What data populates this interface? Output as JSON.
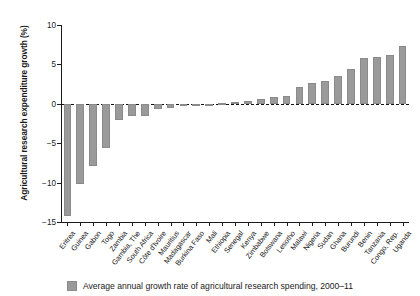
{
  "chart_data": {
    "type": "bar",
    "title": "",
    "subtitle": "",
    "xlabel": "",
    "ylabel": "Agricultural research expenditure growth (%)",
    "ylim": [
      -15,
      10
    ],
    "yticks": [
      10,
      5,
      0,
      -5,
      -10,
      -15
    ],
    "ytick_labels": [
      "10",
      "5",
      "0",
      "−5",
      "−10",
      "−15"
    ],
    "grid": false,
    "zero_line": true,
    "legend_position": "bottom-center",
    "bar_color": "#9a9a9a",
    "categories": [
      "Eritrea",
      "Guinea",
      "Gabon",
      "Togo",
      "Zambia",
      "Gambia, The",
      "South Africa",
      "Côte d'Ivoire",
      "Mauritius",
      "Madagascar",
      "Burkina Faso",
      "Mali",
      "Ethiopia",
      "Senegal",
      "Kenya",
      "Zimbabwe",
      "Botswana",
      "Lesotho",
      "Malawi",
      "Nigeria",
      "Sudan",
      "Ghana",
      "Burundi",
      "Benin",
      "Tanzania",
      "Congo, Rep.",
      "Uganda"
    ],
    "series": [
      {
        "name": "Average annual growth rate of agricultural research spending, 2000–11",
        "values": [
          -14.3,
          -10.2,
          -7.9,
          -5.6,
          -2.0,
          -1.6,
          -1.5,
          -0.6,
          -0.5,
          -0.3,
          -0.2,
          -0.1,
          0.1,
          0.2,
          0.4,
          0.6,
          0.9,
          1.0,
          2.1,
          2.7,
          2.9,
          3.5,
          4.4,
          5.8,
          5.9,
          6.2,
          7.3
        ]
      }
    ]
  },
  "legend": {
    "label": "Average annual growth rate of agricultural research spending, 2000–11",
    "swatch_color": "#9a9a9a"
  }
}
